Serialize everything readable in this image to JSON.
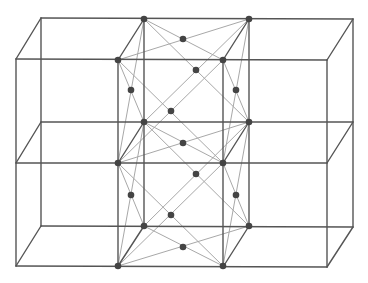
{
  "diagram": {
    "colors": {
      "background": "#ffffff",
      "edge": "#555555",
      "diagonal": "#a8a8a8",
      "node": "#444444"
    },
    "frame_edges": [
      [
        16,
        59,
        327,
        60
      ],
      [
        16,
        163,
        327,
        163
      ],
      [
        16,
        266,
        327,
        267
      ],
      [
        41,
        18,
        353,
        19
      ],
      [
        41,
        122,
        353,
        122
      ],
      [
        41,
        226,
        353,
        227
      ],
      [
        16,
        59,
        16,
        266
      ],
      [
        327,
        60,
        327,
        267
      ],
      [
        41,
        18,
        41,
        226
      ],
      [
        353,
        19,
        353,
        227
      ],
      [
        118,
        60,
        118,
        266
      ],
      [
        223,
        60,
        223,
        267
      ],
      [
        144,
        19,
        144,
        226
      ],
      [
        249,
        19,
        249,
        226
      ],
      [
        16,
        59,
        41,
        18
      ],
      [
        16,
        163,
        41,
        122
      ],
      [
        16,
        266,
        41,
        226
      ],
      [
        327,
        60,
        353,
        19
      ],
      [
        327,
        163,
        353,
        122
      ],
      [
        327,
        267,
        353,
        227
      ],
      [
        118,
        60,
        144,
        19
      ],
      [
        223,
        60,
        249,
        19
      ],
      [
        118,
        163,
        144,
        122
      ],
      [
        223,
        163,
        249,
        122
      ],
      [
        118,
        266,
        144,
        226
      ],
      [
        223,
        267,
        249,
        226
      ]
    ],
    "face_diagonals": [
      [
        144,
        19,
        223,
        60
      ],
      [
        118,
        60,
        249,
        19
      ],
      [
        118,
        60,
        223,
        163
      ],
      [
        223,
        60,
        118,
        163
      ],
      [
        144,
        19,
        249,
        122
      ],
      [
        249,
        19,
        144,
        122
      ],
      [
        118,
        60,
        144,
        122
      ],
      [
        144,
        19,
        118,
        163
      ],
      [
        223,
        60,
        249,
        122
      ],
      [
        249,
        19,
        223,
        163
      ],
      [
        144,
        122,
        223,
        163
      ],
      [
        118,
        163,
        249,
        122
      ],
      [
        118,
        163,
        223,
        266
      ],
      [
        223,
        163,
        118,
        266
      ],
      [
        144,
        122,
        249,
        226
      ],
      [
        249,
        122,
        144,
        226
      ],
      [
        118,
        163,
        144,
        226
      ],
      [
        144,
        122,
        118,
        266
      ],
      [
        223,
        163,
        249,
        226
      ],
      [
        249,
        122,
        223,
        266
      ],
      [
        144,
        226,
        223,
        266
      ],
      [
        118,
        266,
        249,
        226
      ]
    ],
    "corner_nodes": [
      [
        144,
        19
      ],
      [
        249,
        19
      ],
      [
        118,
        60
      ],
      [
        223,
        60
      ],
      [
        144,
        122
      ],
      [
        249,
        122
      ],
      [
        118,
        163
      ],
      [
        223,
        163
      ],
      [
        144,
        226
      ],
      [
        249,
        226
      ],
      [
        118,
        266
      ],
      [
        223,
        266
      ]
    ],
    "face_center_nodes": [
      [
        183,
        39
      ],
      [
        196,
        70
      ],
      [
        171,
        111
      ],
      [
        131,
        90
      ],
      [
        236,
        90
      ],
      [
        183,
        143
      ],
      [
        196,
        174
      ],
      [
        171,
        215
      ],
      [
        131,
        195
      ],
      [
        236,
        195
      ],
      [
        183,
        247
      ]
    ]
  }
}
